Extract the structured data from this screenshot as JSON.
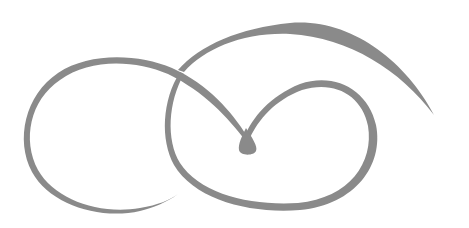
{
  "image": {
    "description": "Decorative calligraphic swirl flourish ornament",
    "background": "#ffffff",
    "stroke_color": "#8a8a8a",
    "width": 469,
    "height": 228
  },
  "ornament": {
    "label": "swirl-flourish",
    "parts": [
      "left-loop",
      "top-arc",
      "inner-right-loop",
      "teardrop-terminal"
    ]
  }
}
